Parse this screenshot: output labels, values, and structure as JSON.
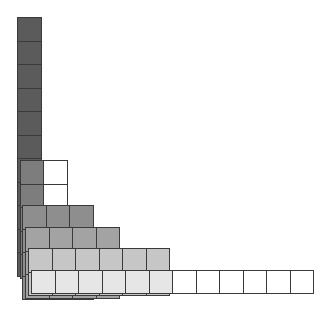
{
  "diagram": {
    "title": "",
    "cell_size": 23.5,
    "layers": [
      {
        "name": "layer-1",
        "left": 17,
        "top": 17,
        "cols": 1,
        "rows": 11,
        "fill": "#5b5b5b",
        "white_from_col": 1
      },
      {
        "name": "layer-2",
        "left": 19.5,
        "top": 160,
        "cols": 2,
        "rows": 5,
        "fill": "#7d7d7d",
        "white_from_col": 1
      },
      {
        "name": "layer-3",
        "left": 22,
        "top": 205,
        "cols": 3,
        "rows": 4,
        "fill": "#8e8e8e",
        "white_from_col": 3
      },
      {
        "name": "layer-4",
        "left": 25,
        "top": 227,
        "cols": 4,
        "rows": 3,
        "fill": "#a3a3a3",
        "white_from_col": 4
      },
      {
        "name": "layer-5",
        "left": 28,
        "top": 248,
        "cols": 6,
        "rows": 2,
        "fill": "#c6c6c6",
        "white_from_col": 6
      },
      {
        "name": "layer-6",
        "left": 31,
        "top": 269.5,
        "cols": 12,
        "rows": 1,
        "fill": "#e6e6e6",
        "white_from_col": 6
      }
    ],
    "colors": {
      "border": "#3a3a3a",
      "empty": "#ffffff"
    }
  }
}
